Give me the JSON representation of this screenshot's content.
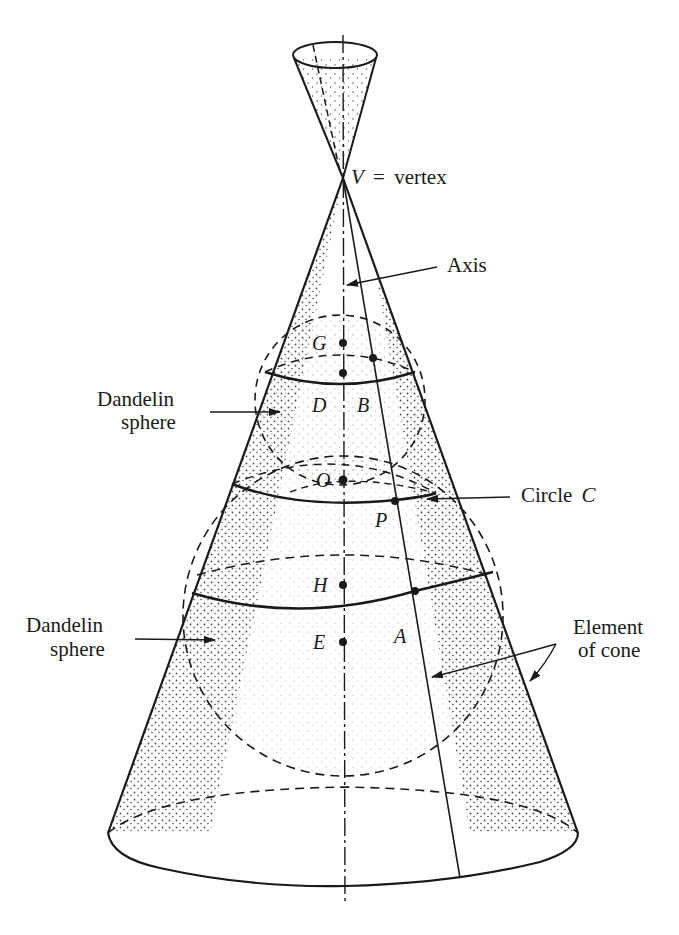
{
  "colors": {
    "ink": "#1a1a1a",
    "paper": "#ffffff",
    "stipple": "#333333"
  },
  "labels": {
    "vertex_var": "V",
    "vertex_eq": "=",
    "vertex_word": "vertex",
    "axis": "Axis",
    "dandelin_upper_1": "Dandelin",
    "dandelin_upper_2": "sphere",
    "dandelin_lower_1": "Dandelin",
    "dandelin_lower_2": "sphere",
    "circle_word": "Circle",
    "circle_var": "C",
    "element_1": "Element",
    "element_2": "of cone"
  },
  "points": {
    "G": "G",
    "D": "D",
    "B": "B",
    "O": "O",
    "P": "P",
    "H": "H",
    "E": "E",
    "A": "A"
  }
}
